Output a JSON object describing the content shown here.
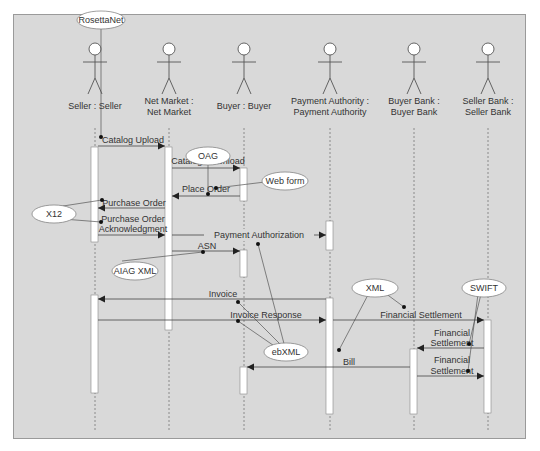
{
  "diagram": {
    "type": "UML sequence diagram",
    "background": "#d9d9d9",
    "actors": [
      {
        "id": "seller",
        "line1": "Seller : Seller",
        "line2": "",
        "x": 95
      },
      {
        "id": "netmarket",
        "line1": "Net Market :",
        "line2": "Net Market",
        "x": 169
      },
      {
        "id": "buyer",
        "line1": "Buyer : Buyer",
        "line2": "",
        "x": 244
      },
      {
        "id": "payauth",
        "line1": "Payment Authority :",
        "line2": "Payment Authority",
        "x": 330
      },
      {
        "id": "buyerbank",
        "line1": "Buyer Bank :",
        "line2": "Buyer Bank",
        "x": 414
      },
      {
        "id": "sellerbank",
        "line1": "Seller Bank :",
        "line2": "Seller Bank",
        "x": 488
      }
    ],
    "messages": [
      {
        "label": "Catalog Upload",
        "from": "seller",
        "to": "netmarket"
      },
      {
        "label": "Catalog Download",
        "from": "netmarket",
        "to": "buyer"
      },
      {
        "label": "Place Order",
        "from": "buyer",
        "to": "netmarket"
      },
      {
        "label": "Purchase Order",
        "from": "netmarket",
        "to": "seller"
      },
      {
        "label": "Purchase Order",
        "label2": "Acknowledgment",
        "from": "seller",
        "to": "netmarket"
      },
      {
        "label": "Payment Authorization",
        "from": "netmarket",
        "to": "payauth"
      },
      {
        "label": "ASN",
        "from": "netmarket",
        "to": "buyer"
      },
      {
        "label": "Invoice",
        "from": "payauth",
        "to": "seller"
      },
      {
        "label": "Invoice Response",
        "from": "seller",
        "to": "payauth"
      },
      {
        "label": "Financial Settlement",
        "from": "payauth",
        "to": "sellerbank"
      },
      {
        "label": "Financial",
        "label2": "Settlement",
        "from": "sellerbank",
        "to": "buyerbank"
      },
      {
        "label": "Bill",
        "from": "buyerbank",
        "to": "buyer"
      },
      {
        "label": "Financial",
        "label2": "Settlement",
        "from": "buyerbank",
        "to": "sellerbank"
      }
    ],
    "standards": [
      {
        "label": "RosettaNet"
      },
      {
        "label": "OAG"
      },
      {
        "label": "Web form"
      },
      {
        "label": "X12"
      },
      {
        "label": "AIAG XML"
      },
      {
        "label": "XML"
      },
      {
        "label": "SWIFT"
      },
      {
        "label": "ebXML"
      }
    ]
  }
}
